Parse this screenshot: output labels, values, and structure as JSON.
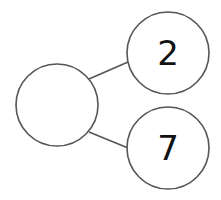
{
  "diagram": {
    "type": "number-bond",
    "whole": {
      "value": ""
    },
    "parts": [
      {
        "value": "2"
      },
      {
        "value": "7"
      }
    ]
  },
  "colors": {
    "stroke": "#555555",
    "text": "#111111",
    "background": "#ffffff"
  }
}
